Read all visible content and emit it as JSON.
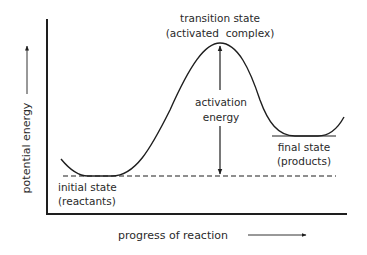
{
  "diagram": {
    "type": "energy-profile",
    "colors": {
      "line": "#1e1e1e",
      "text": "#2a2a2a",
      "background": "#ffffff"
    },
    "y_axis_label": "potential energy",
    "x_axis_label": "progress of reaction",
    "labels": {
      "transition_line1": "transition state",
      "transition_line2": "(activated  complex)",
      "activation_line1": "activation",
      "activation_line2": "energy",
      "final_line1": "final state",
      "final_line2": "(products)",
      "initial_line1": "initial state",
      "initial_line2": "(reactants)"
    }
  }
}
